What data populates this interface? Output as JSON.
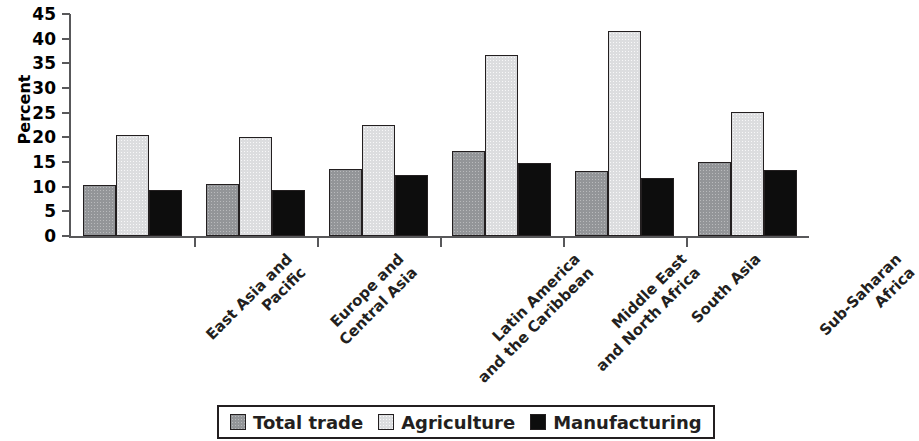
{
  "chart_data": {
    "type": "bar",
    "title": "",
    "xlabel": "",
    "ylabel": "Percent",
    "ylim": [
      0,
      45
    ],
    "yticks": [
      0,
      5,
      10,
      15,
      20,
      25,
      30,
      35,
      40,
      45
    ],
    "grid": false,
    "legend_position": "bottom",
    "categories": [
      "East Asia and Pacific",
      "Europe and Central Asia",
      "Latin America and the Caribbean",
      "Middle East and North Africa",
      "South Asia",
      "Sub-Saharan Africa"
    ],
    "category_lines": [
      [
        "East Asia and",
        "Pacific"
      ],
      [
        "Europe and",
        "Central Asia"
      ],
      [
        "Latin America",
        "and the Caribbean"
      ],
      [
        "Middle East",
        "and North Africa"
      ],
      [
        "South Asia"
      ],
      [
        "Sub-Saharan",
        "Africa"
      ]
    ],
    "series": [
      {
        "name": "Total trade",
        "color": "#939598",
        "values": [
          10.4,
          10.5,
          13.5,
          17.2,
          13.1,
          15.0
        ]
      },
      {
        "name": "Agriculture",
        "color": "#dcdddf",
        "values": [
          20.4,
          20.1,
          22.5,
          36.7,
          41.5,
          25.2
        ]
      },
      {
        "name": "Manufacturing",
        "color": "#0d0d0d",
        "values": [
          9.4,
          9.3,
          12.4,
          14.7,
          11.7,
          13.3
        ]
      }
    ]
  }
}
